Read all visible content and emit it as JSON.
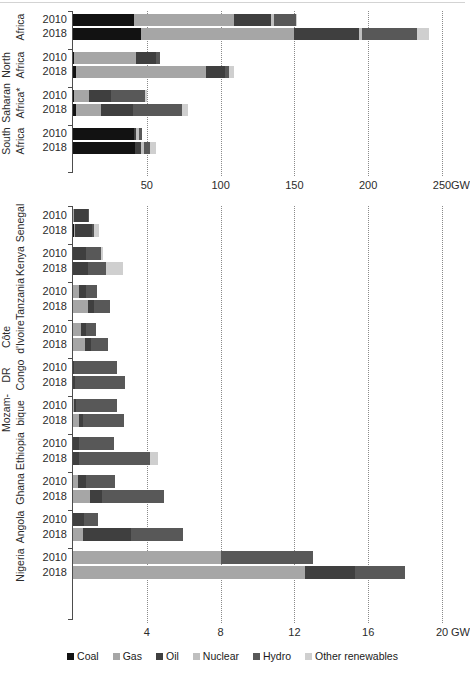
{
  "figure": {
    "caption": "Fossil fuels dominate the power mix but the role of non-hydro renewables is increasing"
  },
  "legend": {
    "position": "bottom-center",
    "items": [
      {
        "label": "Coal",
        "color": "#121212"
      },
      {
        "label": "Gas",
        "color": "#a6a6a6"
      },
      {
        "label": "Oil",
        "color": "#3f3f3f"
      },
      {
        "label": "Nuclear",
        "color": "#bfbfbf"
      },
      {
        "label": "Hydro",
        "color": "#585858"
      },
      {
        "label": "Other renewables",
        "color": "#cfcfcf"
      }
    ]
  },
  "colors": {
    "coal": "#121212",
    "gas": "#a6a6a6",
    "oil": "#3f3f3f",
    "nuclear": "#bfbfbf",
    "hydro": "#585858",
    "other_renewables": "#cfcfcf",
    "axis": "#4d4d4d",
    "grid": "#8a8a8a",
    "text": "#2b2b2b"
  },
  "chart_data": [
    {
      "id": "regions",
      "type": "bar",
      "orientation": "horizontal",
      "stacked": true,
      "title": "",
      "xlabel": "GW",
      "ylabel": "",
      "xlim": [
        0,
        250
      ],
      "xticks": [
        50,
        100,
        150,
        200,
        250
      ],
      "xtick_labels": [
        "50",
        "100",
        "150",
        "200",
        "250"
      ],
      "unit": "GW",
      "grid": "vertical-dotted",
      "series_names": [
        "Coal",
        "Gas",
        "Oil",
        "Nuclear",
        "Hydro",
        "Other renewables"
      ],
      "groups": [
        {
          "label": "Africa",
          "label_lines": [
            "Africa"
          ],
          "rows": [
            {
              "year": "2010",
              "values": {
                "Coal": 41,
                "Gas": 68,
                "Oil": 25,
                "Nuclear": 2,
                "Hydro": 15,
                "Other renewables": 1
              },
              "total": 152
            },
            {
              "year": "2018",
              "values": {
                "Coal": 46,
                "Gas": 104,
                "Oil": 44,
                "Nuclear": 2,
                "Hydro": 37,
                "Other renewables": 8
              },
              "total": 241
            }
          ]
        },
        {
          "label": "North Africa",
          "label_lines": [
            "North",
            "Africa"
          ],
          "rows": [
            {
              "year": "2010",
              "values": {
                "Coal": 1,
                "Gas": 42,
                "Oil": 13,
                "Nuclear": 0,
                "Hydro": 3,
                "Other renewables": 0
              },
              "total": 59
            },
            {
              "year": "2018",
              "values": {
                "Coal": 2,
                "Gas": 88,
                "Oil": 13,
                "Nuclear": 0,
                "Hydro": 3,
                "Other renewables": 3
              },
              "total": 109
            }
          ]
        },
        {
          "label": "Sub-Saharan Africa*",
          "label_lines": [
            "Sub-",
            "Saharan",
            "Africa*"
          ],
          "rows": [
            {
              "year": "2010",
              "values": {
                "Coal": 1,
                "Gas": 10,
                "Oil": 15,
                "Nuclear": 0,
                "Hydro": 23,
                "Other renewables": 1
              },
              "total": 50
            },
            {
              "year": "2018",
              "values": {
                "Coal": 2,
                "Gas": 17,
                "Oil": 22,
                "Nuclear": 0,
                "Hydro": 33,
                "Other renewables": 4
              },
              "total": 78
            }
          ]
        },
        {
          "label": "South Africa",
          "label_lines": [
            "South",
            "Africa"
          ],
          "rows": [
            {
              "year": "2010",
              "values": {
                "Coal": 41,
                "Gas": 0,
                "Oil": 2,
                "Nuclear": 2,
                "Hydro": 2,
                "Other renewables": 0
              },
              "total": 47
            },
            {
              "year": "2018",
              "values": {
                "Coal": 42,
                "Gas": 0,
                "Oil": 4,
                "Nuclear": 2,
                "Hydro": 4,
                "Other renewables": 4
              },
              "total": 56
            }
          ]
        }
      ]
    },
    {
      "id": "countries",
      "type": "bar",
      "orientation": "horizontal",
      "stacked": true,
      "title": "",
      "xlabel": "GW",
      "ylabel": "",
      "xlim": [
        0,
        20
      ],
      "xticks": [
        4,
        8,
        12,
        16,
        20
      ],
      "xtick_labels": [
        "4",
        "8",
        "12",
        "16",
        "20"
      ],
      "unit": "GW",
      "grid": "vertical-dotted",
      "series_names": [
        "Coal",
        "Gas",
        "Oil",
        "Nuclear",
        "Hydro",
        "Other renewables"
      ],
      "groups": [
        {
          "label": "Senegal",
          "label_lines": [
            "Senegal"
          ],
          "rows": [
            {
              "year": "2010",
              "values": {
                "Coal": 0,
                "Gas": 0.05,
                "Oil": 0.75,
                "Nuclear": 0,
                "Hydro": 0.05,
                "Other renewables": 0
              },
              "total": 0.85
            },
            {
              "year": "2018",
              "values": {
                "Coal": 0.05,
                "Gas": 0.05,
                "Oil": 0.95,
                "Nuclear": 0,
                "Hydro": 0.1,
                "Other renewables": 0.25
              },
              "total": 1.4
            }
          ]
        },
        {
          "label": "Kenya",
          "label_lines": [
            "Kenya"
          ],
          "rows": [
            {
              "year": "2010",
              "values": {
                "Coal": 0,
                "Gas": 0,
                "Oil": 0.7,
                "Nuclear": 0,
                "Hydro": 0.8,
                "Other renewables": 0.15
              },
              "total": 1.65
            },
            {
              "year": "2018",
              "values": {
                "Coal": 0,
                "Gas": 0,
                "Oil": 0.8,
                "Nuclear": 0,
                "Hydro": 1.0,
                "Other renewables": 0.9
              },
              "total": 2.7
            }
          ]
        },
        {
          "label": "Tanzania",
          "label_lines": [
            "Tanzania"
          ],
          "rows": [
            {
              "year": "2010",
              "values": {
                "Coal": 0,
                "Gas": 0.35,
                "Oil": 0.35,
                "Nuclear": 0,
                "Hydro": 0.6,
                "Other renewables": 0
              },
              "total": 1.3
            },
            {
              "year": "2018",
              "values": {
                "Coal": 0,
                "Gas": 0.8,
                "Oil": 0.35,
                "Nuclear": 0,
                "Hydro": 0.85,
                "Other renewables": 0
              },
              "total": 2.0
            }
          ]
        },
        {
          "label": "Côte d'Ivoire",
          "label_lines": [
            "Côte",
            "d'Ivoire"
          ],
          "rows": [
            {
              "year": "2010",
              "values": {
                "Coal": 0,
                "Gas": 0.45,
                "Oil": 0.25,
                "Nuclear": 0,
                "Hydro": 0.55,
                "Other renewables": 0
              },
              "total": 1.25
            },
            {
              "year": "2018",
              "values": {
                "Coal": 0,
                "Gas": 0.65,
                "Oil": 0.35,
                "Nuclear": 0,
                "Hydro": 0.9,
                "Other renewables": 0
              },
              "total": 1.9
            }
          ]
        },
        {
          "label": "DR Congo",
          "label_lines": [
            "DR",
            "Congo"
          ],
          "rows": [
            {
              "year": "2010",
              "values": {
                "Coal": 0,
                "Gas": 0,
                "Oil": 0.05,
                "Nuclear": 0,
                "Hydro": 2.35,
                "Other renewables": 0
              },
              "total": 2.4
            },
            {
              "year": "2018",
              "values": {
                "Coal": 0,
                "Gas": 0,
                "Oil": 0.1,
                "Nuclear": 0,
                "Hydro": 2.7,
                "Other renewables": 0
              },
              "total": 2.8
            }
          ]
        },
        {
          "label": "Mozambique",
          "label_lines": [
            "Mozam-",
            "bique"
          ],
          "rows": [
            {
              "year": "2010",
              "values": {
                "Coal": 0,
                "Gas": 0.05,
                "Oil": 0.1,
                "Nuclear": 0,
                "Hydro": 2.25,
                "Other renewables": 0
              },
              "total": 2.4
            },
            {
              "year": "2018",
              "values": {
                "Coal": 0,
                "Gas": 0.35,
                "Oil": 0.2,
                "Nuclear": 0,
                "Hydro": 2.2,
                "Other renewables": 0
              },
              "total": 2.75
            }
          ]
        },
        {
          "label": "Ethiopia",
          "label_lines": [
            "Ethiopia"
          ],
          "rows": [
            {
              "year": "2010",
              "values": {
                "Coal": 0,
                "Gas": 0,
                "Oil": 0.3,
                "Nuclear": 0,
                "Hydro": 1.9,
                "Other renewables": 0
              },
              "total": 2.2
            },
            {
              "year": "2018",
              "values": {
                "Coal": 0,
                "Gas": 0,
                "Oil": 0.35,
                "Nuclear": 0,
                "Hydro": 3.8,
                "Other renewables": 0.45
              },
              "total": 4.6
            }
          ]
        },
        {
          "label": "Ghana",
          "label_lines": [
            "Ghana"
          ],
          "rows": [
            {
              "year": "2010",
              "values": {
                "Coal": 0,
                "Gas": 0.25,
                "Oil": 0.45,
                "Nuclear": 0,
                "Hydro": 1.6,
                "Other renewables": 0
              },
              "total": 2.3
            },
            {
              "year": "2018",
              "values": {
                "Coal": 0,
                "Gas": 0.9,
                "Oil": 0.65,
                "Nuclear": 0,
                "Hydro": 3.4,
                "Other renewables": 0
              },
              "total": 4.95
            }
          ]
        },
        {
          "label": "Angola",
          "label_lines": [
            "Angola"
          ],
          "rows": [
            {
              "year": "2010",
              "values": {
                "Coal": 0,
                "Gas": 0,
                "Oil": 0.6,
                "Nuclear": 0,
                "Hydro": 0.75,
                "Other renewables": 0
              },
              "total": 1.35
            },
            {
              "year": "2018",
              "values": {
                "Coal": 0,
                "Gas": 0.55,
                "Oil": 2.6,
                "Nuclear": 0,
                "Hydro": 2.8,
                "Other renewables": 0
              },
              "total": 5.95
            }
          ]
        },
        {
          "label": "Nigeria",
          "label_lines": [
            "Nigeria"
          ],
          "rows": [
            {
              "year": "2010",
              "values": {
                "Coal": 0,
                "Gas": 8.0,
                "Oil": 0,
                "Nuclear": 0,
                "Hydro": 5.0,
                "Other renewables": 0
              },
              "total": 13.0
            },
            {
              "year": "2018",
              "values": {
                "Coal": 0,
                "Gas": 12.6,
                "Oil": 2.7,
                "Nuclear": 0,
                "Hydro": 2.7,
                "Other renewables": 0
              },
              "total": 18.0
            }
          ]
        }
      ]
    }
  ]
}
